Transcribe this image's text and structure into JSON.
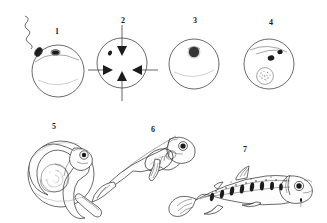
{
  "figure": {
    "background_color": "#ffffff",
    "ink_color": "#2b2b2b",
    "width": 327,
    "height": 223,
    "style": "pen-and-ink line drawing"
  },
  "stages": [
    {
      "number": "1",
      "label_x": 55,
      "label_y": 28,
      "subject": "unfertilized egg with spermatozoon approaching micropyle",
      "shapes": "circle with wavy-tailed sperm above-left and small dark micropyle mark on top of egg"
    },
    {
      "number": "2",
      "label_x": 121,
      "label_y": 17,
      "subject": "egg with four converging arrows, water hardening",
      "shapes": "circle with inward arrows from top, left, right, bottom and a small dark dot inside upper-left"
    },
    {
      "number": "3",
      "label_x": 193,
      "label_y": 17,
      "subject": "fertilized egg with blastodisc forming",
      "shapes": "circle with dark round blastodisc in upper middle"
    },
    {
      "number": "4",
      "label_x": 269,
      "label_y": 19,
      "subject": "egg with developing eyes, eyed-ova stage",
      "shapes": "circle with two dark eye spots upper right and stippled embryonic mass lower centre"
    },
    {
      "number": "5",
      "label_x": 52,
      "label_y": 123,
      "subject": "embryo curled around yolk sac inside the egg",
      "shapes": "large circle with coiled embryo, head and eye at right, tail curving down"
    },
    {
      "number": "6",
      "label_x": 151,
      "label_y": 126,
      "subject": "newly hatched alevin with attached yolk sac",
      "shapes": "larval fish angled up-right with large ventral yolk sac"
    },
    {
      "number": "7",
      "label_x": 243,
      "label_y": 146,
      "subject": "juvenile parr with vertical parr marks",
      "shapes": "young fish facing right with dorsal, adipose, anal and forked caudal fins and dark vertical bars"
    }
  ]
}
